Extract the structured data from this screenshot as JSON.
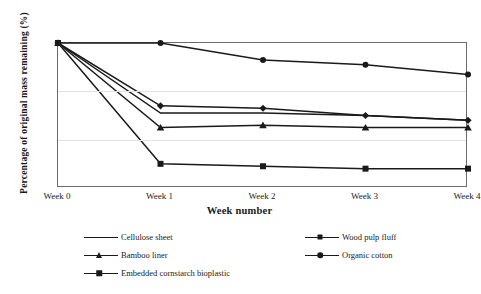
{
  "chart_data": {
    "type": "line",
    "title": "",
    "xlabel": "Week number",
    "ylabel": "Percentage of original mass remaining (%)",
    "categories": [
      "Week 0",
      "Week 1",
      "Week 2",
      "Week 3",
      "Week 4"
    ],
    "x": [
      0,
      1,
      2,
      3,
      4
    ],
    "ylim": [
      40,
      100
    ],
    "yticks": [
      40,
      60,
      80,
      100
    ],
    "grid": true,
    "legend_position": "bottom",
    "series": [
      {
        "name": "Cellulose sheet",
        "marker": "none",
        "values": [
          100,
          71,
          71,
          70,
          68
        ]
      },
      {
        "name": "Wood pulp fluff",
        "marker": "diamond",
        "values": [
          100,
          74,
          73,
          70,
          68
        ]
      },
      {
        "name": "Bamboo liner",
        "marker": "triangle",
        "values": [
          100,
          65,
          66,
          65,
          65
        ]
      },
      {
        "name": "Organic cotton",
        "marker": "circle",
        "values": [
          100,
          100,
          93,
          91,
          87
        ]
      },
      {
        "name": "Embedded cornstarch bioplastic",
        "marker": "square",
        "values": [
          100,
          50,
          49,
          48,
          48
        ]
      }
    ]
  }
}
